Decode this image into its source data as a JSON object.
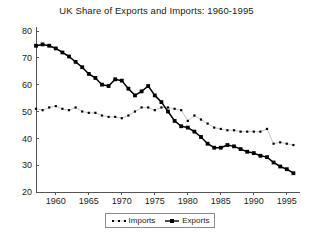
{
  "chart_data": {
    "type": "line",
    "title": "UK Share of Exports and Imports: 1960-1995",
    "xlabel": "",
    "ylabel": "",
    "xlim": [
      1957,
      1997
    ],
    "ylim": [
      20,
      80
    ],
    "ytick_labels": [
      "20",
      "30",
      "40",
      "50",
      "60",
      "70",
      "80"
    ],
    "yticks": [
      20,
      30,
      40,
      50,
      60,
      70,
      80
    ],
    "xtick_labels": [
      "1960",
      "1965",
      "1970",
      "1975",
      "1980",
      "1985",
      "1990",
      "1995"
    ],
    "xticks": [
      1960,
      1965,
      1970,
      1975,
      1980,
      1985,
      1990,
      1995
    ],
    "grid": false,
    "legend_position": "bottom-center",
    "x": [
      1957,
      1958,
      1959,
      1960,
      1961,
      1962,
      1963,
      1964,
      1965,
      1966,
      1967,
      1968,
      1969,
      1970,
      1971,
      1972,
      1973,
      1974,
      1975,
      1976,
      1977,
      1978,
      1979,
      1980,
      1981,
      1982,
      1983,
      1984,
      1985,
      1986,
      1987,
      1988,
      1989,
      1990,
      1991,
      1992,
      1993,
      1994,
      1995,
      1996
    ],
    "series": [
      {
        "name": "Imports",
        "marker": "dotted-square",
        "color": "#000000",
        "values": [
          51.0,
          50.5,
          51.5,
          52.0,
          51.0,
          50.5,
          51.5,
          50.0,
          49.5,
          49.5,
          48.5,
          48.0,
          48.0,
          47.5,
          48.5,
          50.0,
          51.5,
          51.5,
          50.5,
          51.5,
          51.5,
          51.0,
          50.5,
          46.5,
          48.5,
          47.0,
          45.5,
          44.0,
          43.5,
          43.0,
          43.0,
          42.5,
          42.5,
          42.5,
          42.5,
          43.5,
          38.0,
          38.5,
          38.0,
          37.5
        ]
      },
      {
        "name": "Exports",
        "marker": "filled-square",
        "color": "#000000",
        "values": [
          74.5,
          75.0,
          74.5,
          73.5,
          72.0,
          70.5,
          68.5,
          66.5,
          64.0,
          62.5,
          60.0,
          59.5,
          62.0,
          61.5,
          58.5,
          56.0,
          57.5,
          59.5,
          56.0,
          53.5,
          50.0,
          46.5,
          44.5,
          44.0,
          42.5,
          40.5,
          38.0,
          36.5,
          36.5,
          37.5,
          37.0,
          36.0,
          35.0,
          34.5,
          33.5,
          33.0,
          31.0,
          29.5,
          28.5,
          27.0
        ]
      }
    ]
  }
}
